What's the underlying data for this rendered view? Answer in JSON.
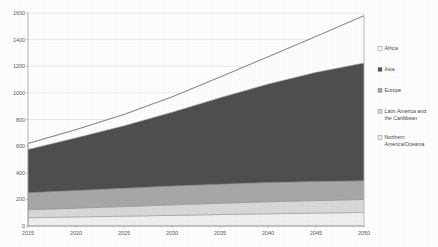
{
  "chart_data": {
    "type": "area",
    "stacked": true,
    "title": "",
    "subtitle": "",
    "xlabel": "",
    "ylabel": "",
    "x": [
      2015,
      2020,
      2025,
      2030,
      2035,
      2040,
      2045,
      2050
    ],
    "tick_labels_x": [
      "2015",
      "2020",
      "2025",
      "2030",
      "2035",
      "2040",
      "2045",
      "2050"
    ],
    "tick_labels_y": [
      "0",
      "200",
      "400",
      "600",
      "800",
      "1000",
      "1200",
      "1400",
      "1600"
    ],
    "xlim": [
      2015,
      2050
    ],
    "ylim": [
      0,
      1600
    ],
    "ytick_step": 200,
    "grid": true,
    "legend_position": "right",
    "series": [
      {
        "name": "Northern America/Oceania",
        "color": "#f0f0f0",
        "values": [
          62,
          68,
          74,
          80,
          86,
          92,
          97,
          102
        ]
      },
      {
        "name": "Latin America and the Caribbean",
        "color": "#d9d9d9",
        "values": [
          60,
          66,
          72,
          79,
          85,
          90,
          94,
          97
        ]
      },
      {
        "name": "Europe",
        "color": "#a8a8a8",
        "values": [
          128,
          133,
          137,
          141,
          143,
          144,
          143,
          141
        ]
      },
      {
        "name": "Asia",
        "color": "#4f4f4f",
        "values": [
          325,
          395,
          470,
          555,
          650,
          740,
          820,
          885
        ]
      },
      {
        "name": "Africa",
        "color": "#fdfdfd",
        "values": [
          45,
          62,
          85,
          115,
          155,
          205,
          270,
          355
        ]
      }
    ],
    "totals": [
      620,
      724,
      838,
      970,
      1119,
      1271,
      1424,
      1580
    ],
    "legend_entries": [
      "Africa",
      "Asia",
      "Europe",
      "Latin America and the Caribbean",
      "Northern America/Oceania"
    ],
    "legend_colors": {
      "Africa": "#fdfdfd",
      "Asia": "#4f4f4f",
      "Europe": "#a8a8a8",
      "Latin America and the Caribbean": "#d9d9d9",
      "Northern America/Oceania": "#f0f0f0"
    }
  }
}
